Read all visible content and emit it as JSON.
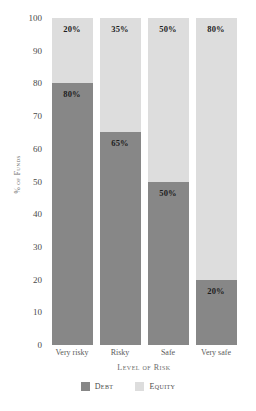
{
  "chart_data": {
    "type": "bar",
    "subtype": "stacked-100-percent",
    "title": "",
    "subtitle": "",
    "xlabel": "Level of Risk",
    "ylabel": "% of Funds",
    "ylim": [
      0,
      100
    ],
    "yticks": [
      0,
      10,
      20,
      30,
      40,
      50,
      60,
      70,
      80,
      90,
      100
    ],
    "ytick_labels": [
      "0",
      "10",
      "20",
      "30",
      "40",
      "50",
      "60",
      "70",
      "80",
      "90",
      "100"
    ],
    "grid": false,
    "legend_position": "bottom",
    "categories": [
      "Very risky",
      "Risky",
      "Safe",
      "Very safe"
    ],
    "series": [
      {
        "name": "Debt",
        "color": "#878787",
        "values": [
          80,
          65,
          50,
          20
        ],
        "data_labels": [
          "80%",
          "65%",
          "50%",
          "20%"
        ]
      },
      {
        "name": "Equity",
        "color": "#dddddd",
        "values": [
          20,
          35,
          50,
          80
        ],
        "data_labels": [
          "20%",
          "35%",
          "50%",
          "80%"
        ]
      }
    ],
    "annotations": []
  },
  "legend": {
    "items": [
      {
        "label": "Debt",
        "color": "#878787"
      },
      {
        "label": "Equity",
        "color": "#dddddd"
      }
    ]
  },
  "colors": {
    "debt": "#878787",
    "equity": "#dddddd",
    "background": "#ffffff",
    "tick_text": "#4a4a4a",
    "axis_title_text": "#6b6b6b",
    "data_label_text": "#1d1d1d"
  }
}
